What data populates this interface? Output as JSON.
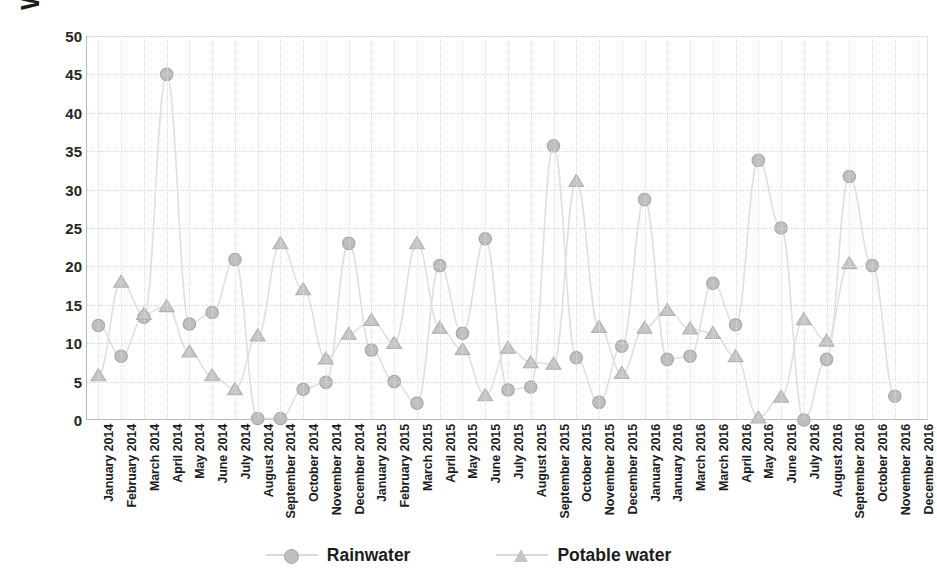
{
  "chart_data": {
    "type": "line",
    "title": "",
    "xlabel": "",
    "ylabel": "Water consumption (m³)",
    "ylim": [
      0,
      50
    ],
    "yticks": [
      0,
      5,
      10,
      15,
      20,
      25,
      30,
      35,
      40,
      45,
      50
    ],
    "grid": true,
    "legend_position": "bottom",
    "categories": [
      "January 2014",
      "February 2014",
      "March 2014",
      "April 2014",
      "May 2014",
      "June 2014",
      "July 2014",
      "August 2014",
      "September 2014",
      "October 2014",
      "November 2014",
      "December 2014",
      "January 2015",
      "February 2015",
      "March 2015",
      "April 2015",
      "May 2015",
      "June 2015",
      "July 2015",
      "August 2015",
      "September 2015",
      "October 2015",
      "November 2015",
      "December 2015",
      "January 2016",
      "January 2016",
      "March 2016",
      "March 2016",
      "April 2016",
      "May 2016",
      "June 2016",
      "July 2016",
      "August 2016",
      "September 2016",
      "October 2016",
      "November 2016",
      "December 2016"
    ],
    "series": [
      {
        "name": "Rainwater",
        "marker": "circle",
        "color": "#bfbfbf",
        "values": [
          12.3,
          8.3,
          13.4,
          45.0,
          12.5,
          14.0,
          20.9,
          0.2,
          0.2,
          4.0,
          4.9,
          23.0,
          9.1,
          5.0,
          2.2,
          20.1,
          11.3,
          23.6,
          3.9,
          4.3,
          35.7,
          8.1,
          2.3,
          9.6,
          28.7,
          7.9,
          8.3,
          17.8,
          12.4,
          33.8,
          25.0,
          0.0,
          7.9,
          31.7,
          20.1,
          3.1,
          null
        ]
      },
      {
        "name": "Potable water",
        "marker": "triangle",
        "color": "#c6c6c6",
        "values": [
          5.8,
          18.0,
          13.8,
          14.8,
          8.9,
          5.8,
          4.0,
          11.0,
          23.0,
          17.0,
          8.0,
          11.2,
          13.0,
          10.0,
          23.0,
          12.0,
          9.2,
          3.2,
          9.4,
          7.5,
          7.3,
          31.1,
          12.1,
          6.1,
          12.0,
          14.3,
          11.9,
          11.3,
          8.3,
          0.3,
          3.0,
          13.1,
          10.3,
          20.4,
          null,
          null,
          null
        ]
      }
    ]
  },
  "legend": {
    "items": [
      {
        "label": "Rainwater"
      },
      {
        "label": "Potable water"
      }
    ]
  }
}
